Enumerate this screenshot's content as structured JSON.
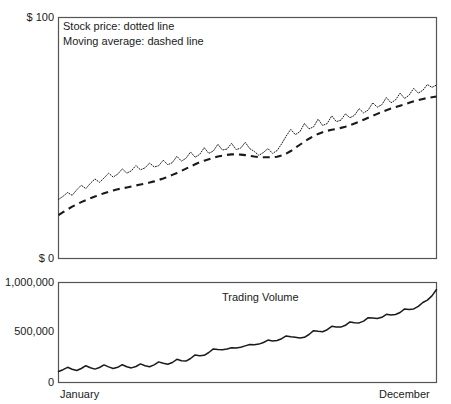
{
  "chart_data": {
    "type": "line",
    "title": "",
    "panels": [
      {
        "name": "price-panel",
        "ylabel_top": "$ 100",
        "ylabel_bottom": "$ 0",
        "ylim": [
          0,
          100
        ],
        "xlim_labels": [
          "January",
          "December"
        ],
        "grid": false,
        "legend_position": "top-left-inside",
        "series": [
          {
            "name": "Stock price",
            "style": "dotted",
            "legend": "Stock price: dotted line",
            "values": [
              24.5,
              25.8,
              27.4,
              26.2,
              28.5,
              30.4,
              29.0,
              31.2,
              33.0,
              31.6,
              33.4,
              35.4,
              33.8,
              35.0,
              37.2,
              35.4,
              36.4,
              38.6,
              36.8,
              37.6,
              39.6,
              38.0,
              38.5,
              40.8,
              38.9,
              39.8,
              42.4,
              40.4,
              41.6,
              44.2,
              42.0,
              43.2,
              46.0,
              43.6,
              44.6,
              47.4,
              45.0,
              45.4,
              47.8,
              45.2,
              45.8,
              48.2,
              45.6,
              44.4,
              42.8,
              44.0,
              45.6,
              43.6,
              44.8,
              47.6,
              50.8,
              53.6,
              51.4,
              52.6,
              56.0,
              53.8,
              54.6,
              57.8,
              55.2,
              56.0,
              59.2,
              56.8,
              57.4,
              60.0,
              58.4,
              59.4,
              62.2,
              60.4,
              61.6,
              64.6,
              62.8,
              63.8,
              66.8,
              64.6,
              65.8,
              68.6,
              66.4,
              67.8,
              70.6,
              68.6,
              69.8,
              72.2,
              71.0,
              72.0
            ]
          },
          {
            "name": "Moving average",
            "style": "dashed",
            "legend": "Moving average: dashed line",
            "values": [
              18.0,
              19.2,
              20.4,
              21.5,
              22.5,
              23.4,
              24.2,
              25.0,
              25.7,
              26.4,
              27.1,
              27.7,
              28.2,
              28.7,
              29.1,
              29.5,
              29.9,
              30.3,
              30.7,
              31.1,
              31.5,
              32.0,
              32.6,
              33.2,
              33.9,
              34.7,
              35.5,
              36.4,
              37.3,
              38.2,
              39.1,
              39.9,
              40.6,
              41.2,
              41.8,
              42.3,
              42.7,
              43.0,
              43.2,
              43.2,
              43.1,
              42.9,
              42.6,
              42.3,
              42.1,
              42.0,
              42.0,
              42.0,
              42.2,
              42.7,
              43.5,
              44.6,
              45.9,
              47.2,
              48.5,
              49.7,
              50.8,
              51.7,
              52.4,
              53.0,
              53.4,
              53.8,
              54.2,
              54.7,
              55.3,
              56.0,
              56.8,
              57.6,
              58.4,
              59.2,
              60.0,
              60.8,
              61.5,
              62.2,
              62.8,
              63.4,
              64.0,
              64.6,
              65.2,
              65.7,
              66.2,
              66.6,
              66.9,
              67.2
            ]
          }
        ]
      },
      {
        "name": "volume-panel",
        "ylabel_top": "1,000,000",
        "ylabel_mid": "500,000",
        "ylabel_bottom": "0",
        "ylim": [
          0,
          1000000
        ],
        "grid": false,
        "series": [
          {
            "name": "Trading Volume",
            "style": "solid",
            "label": "Trading Volume",
            "values": [
              110000,
              128000,
              152000,
              132000,
              120000,
              140000,
              168000,
              148000,
              134000,
              150000,
              176000,
              156000,
              140000,
              152000,
              178000,
              158000,
              146000,
              160000,
              186000,
              168000,
              158000,
              176000,
              206000,
              192000,
              182000,
              200000,
              232000,
              218000,
              214000,
              240000,
              276000,
              268000,
              272000,
              300000,
              336000,
              330000,
              328000,
              336000,
              348000,
              346000,
              352000,
              366000,
              380000,
              378000,
              384000,
              400000,
              424000,
              416000,
              420000,
              438000,
              466000,
              458000,
              452000,
              444000,
              452000,
              480000,
              518000,
              512000,
              508000,
              528000,
              562000,
              556000,
              554000,
              572000,
              606000,
              598000,
              596000,
              614000,
              648000,
              644000,
              640000,
              652000,
              682000,
              676000,
              680000,
              700000,
              736000,
              730000,
              736000,
              762000,
              800000,
              824000,
              866000,
              930000
            ]
          }
        ]
      }
    ]
  },
  "price_panel": {
    "legend": {
      "stock_price": "Stock price: dotted line",
      "moving_average": "Moving average: dashed line"
    },
    "axis": {
      "top_label": "$ 100",
      "bottom_label": "$ 0"
    }
  },
  "volume_panel": {
    "series_label": "Trading Volume",
    "axis": {
      "top_label": "1,000,000",
      "mid_label": "500,000",
      "bottom_label": "0"
    }
  },
  "x_axis": {
    "start_label": "January",
    "end_label": "December"
  },
  "colors": {
    "frame": "#555555",
    "ink": "#1a1a1a",
    "background": "#ffffff"
  }
}
